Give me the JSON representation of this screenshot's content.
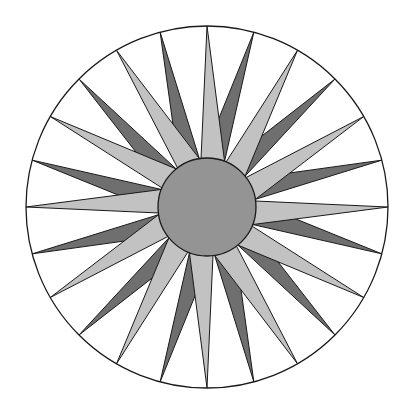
{
  "figure": {
    "type": "geometric-diagram",
    "background_color": "#ffffff",
    "canvas": {
      "width": 413,
      "height": 416
    }
  },
  "chart_data": {
    "type": "diagram",
    "subtitle": "",
    "xlabel": "",
    "ylabel": "",
    "geometry": {
      "center": {
        "x": 207,
        "y": 207
      },
      "outer_circle_radius": 181,
      "inner_circle_radius": 49,
      "ray_count_light": 12,
      "ray_count_dark": 12,
      "ray_count_total": 24,
      "angular_step_degrees": 30,
      "light_apex_offset_degrees": 0,
      "dark_apex_offset_degrees": 15,
      "light_base_half_width_degrees": 14,
      "light_base_skew_degrees": 7,
      "dark_base_half_width_degrees": 13,
      "dark_base_skew_degrees": -7,
      "symmetry": "12-fold rotational",
      "grid": false,
      "legend": "none"
    },
    "colors": {
      "background": "#ffffff",
      "outline": "#1a1a1a",
      "light_ray_fill": "#c2c2c2",
      "dark_ray_fill": "#6f6f6f",
      "inner_circle_fill": "#949494",
      "outer_circle_fill": "#ffffff"
    },
    "stroke_widths": {
      "outer_circle": 1.3,
      "ray": 1.0,
      "inner_circle": 1.3
    },
    "series": [
      {
        "name": "Light rays",
        "fill": "#c2c2c2",
        "count": 12,
        "apex_angles_degrees": [
          270,
          300,
          330,
          0,
          30,
          60,
          90,
          120,
          150,
          180,
          210,
          240
        ]
      },
      {
        "name": "Dark rays",
        "fill": "#6f6f6f",
        "count": 12,
        "apex_angles_degrees": [
          285,
          315,
          345,
          15,
          45,
          75,
          105,
          135,
          165,
          195,
          225,
          255
        ]
      }
    ]
  },
  "labels": {
    "outer_circle_name": "outer-boundary-circle",
    "inner_circle_name": "center-disc",
    "light_ray_name": "light-ray",
    "dark_ray_name": "dark-ray"
  }
}
